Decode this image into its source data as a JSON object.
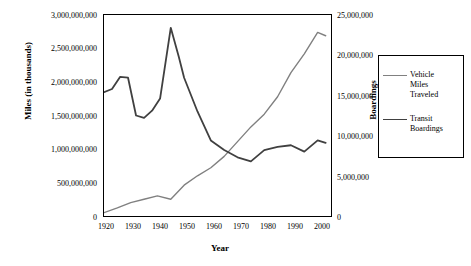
{
  "chart_data": {
    "type": "line",
    "title": "",
    "xlabel": "Year",
    "ylabel": "Miles (in thousands)",
    "y2label": "Boardings",
    "xlim": [
      1920,
      2005
    ],
    "ylim": [
      0,
      3000000000
    ],
    "y2lim": [
      0,
      25000000
    ],
    "grid": false,
    "legend_position": "right",
    "x_ticks": [
      "1920",
      "1930",
      "1940",
      "1950",
      "1960",
      "1970",
      "1980",
      "1990",
      "2000"
    ],
    "y_left_ticks": [
      "0",
      "500,000,000",
      "1,000,000,000",
      "1,500,000,000",
      "2,000,000,000",
      "2,500,000,000",
      "3,000,000,000"
    ],
    "y_right_ticks": [
      "0",
      "5,000,000",
      "10,000,000",
      "15,000,000",
      "20,000,000",
      "25,000,000"
    ],
    "series": [
      {
        "name": "Vehicle Miles Traveled",
        "axis": "left",
        "color": "#808080",
        "x": [
          1920,
          1925,
          1930,
          1935,
          1940,
          1945,
          1950,
          1955,
          1960,
          1965,
          1970,
          1975,
          1980,
          1985,
          1990,
          1995,
          2000,
          2003
        ],
        "values": [
          50000000,
          120000000,
          200000000,
          250000000,
          300000000,
          250000000,
          460000000,
          600000000,
          720000000,
          890000000,
          1110000000,
          1330000000,
          1520000000,
          1780000000,
          2140000000,
          2420000000,
          2740000000,
          2690000000
        ]
      },
      {
        "name": "Transit Boardings",
        "axis": "right",
        "color": "#404040",
        "x": [
          1920,
          1923,
          1926,
          1929,
          1932,
          1935,
          1938,
          1941,
          1945,
          1948,
          1950,
          1955,
          1960,
          1965,
          1970,
          1975,
          1980,
          1985,
          1990,
          1995,
          2000,
          2003
        ],
        "values": [
          15400000,
          15800000,
          17300000,
          17200000,
          12500000,
          12200000,
          13100000,
          14600000,
          23400000,
          19800000,
          17200000,
          13000000,
          9400000,
          8200000,
          7300000,
          6800000,
          8200000,
          8600000,
          8800000,
          8000000,
          9400000,
          9100000
        ]
      }
    ],
    "legend_entries": [
      {
        "label_lines": [
          "Vehicle",
          "Miles",
          "Traveled"
        ],
        "color": "#808080"
      },
      {
        "label_lines": [
          "Transit",
          "Boardings"
        ],
        "color": "#404040"
      }
    ]
  }
}
